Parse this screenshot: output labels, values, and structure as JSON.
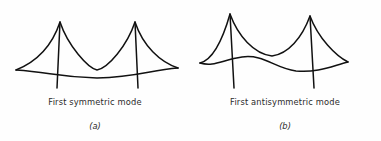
{
  "figure": {
    "background_color": "#fefefe",
    "ink_color": "#111111",
    "panels": [
      {
        "id": "a",
        "caption": "First symmetric mode",
        "sublabel": "(a)",
        "diagram_name": "suspension-bridge-first-symmetric-mode",
        "towers": [
          {
            "name": "left-tower",
            "apex_x": 60,
            "apex_y": 22,
            "base_x": 57,
            "base_y": 88
          },
          {
            "name": "right-tower",
            "apex_x": 135,
            "apex_y": 22,
            "base_x": 138,
            "base_y": 88
          }
        ],
        "anchors": [
          {
            "name": "left-anchor",
            "x": 16,
            "y": 70
          },
          {
            "name": "right-anchor",
            "x": 178,
            "y": 68
          }
        ],
        "cable_path": "M16,70 C36,62 52,46 60,22 C68,46 88,68 97,70 C108,68 127,46 135,22 C143,46 160,62 178,68",
        "deck_path": "M16,70 C50,72 56,77 97,78 C138,77 150,70 178,68",
        "left_tower_path": "M60,22 L57,88",
        "right_tower_path": "M135,22 L138,88"
      },
      {
        "id": "b",
        "caption": "First antisymmetric mode",
        "sublabel": "(b)",
        "diagram_name": "suspension-bridge-first-antisymmetric-mode",
        "towers": [
          {
            "name": "left-tower",
            "apex_x": 40,
            "apex_y": 14,
            "base_x": 44,
            "base_y": 88
          },
          {
            "name": "right-tower",
            "apex_x": 120,
            "apex_y": 16,
            "base_x": 124,
            "base_y": 88
          }
        ],
        "anchors": [
          {
            "name": "left-anchor",
            "x": 10,
            "y": 63
          },
          {
            "name": "right-anchor",
            "x": 158,
            "y": 62
          }
        ],
        "cable_path": "M10,63 C22,60 32,42 40,14 C48,36 64,54 82,56 C98,54 112,38 120,16 C128,38 146,56 158,62",
        "deck_path": "M10,63 C24,67 32,60 52,57 C74,54 84,68 106,71 C128,73 142,66 158,62",
        "left_tower_path": "M40,14 L44,88",
        "right_tower_path": "M120,16 L124,88"
      }
    ]
  }
}
